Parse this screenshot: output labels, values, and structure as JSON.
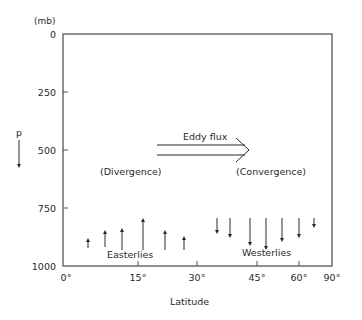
{
  "diagram": {
    "y_unit": "(mb)",
    "y_axis_symbol": "p",
    "y_ticks": [
      {
        "label": "0",
        "y": 34
      },
      {
        "label": "250",
        "y": 92
      },
      {
        "label": "500",
        "y": 150
      },
      {
        "label": "750",
        "y": 208
      },
      {
        "label": "1000",
        "y": 266
      }
    ],
    "x_ticks": [
      {
        "label": "0°",
        "x": 63
      },
      {
        "label": "15°",
        "x": 138
      },
      {
        "label": "30°",
        "x": 197
      },
      {
        "label": "45°",
        "x": 257
      },
      {
        "label": "60°",
        "x": 299
      },
      {
        "label": "90°",
        "x": 332
      }
    ],
    "x_label": "Latitude",
    "eddy_flux_label": "Eddy flux",
    "divergence_label": "(Divergence)",
    "convergence_label": "(Convergence)",
    "easterlies_label": "Easterlies",
    "westerlies_label": "Westerlies",
    "upward_arrows": [
      {
        "x": 88,
        "y1": 248,
        "y2": 240
      },
      {
        "x": 105,
        "y1": 247,
        "y2": 232
      },
      {
        "x": 122,
        "y1": 250,
        "y2": 230
      },
      {
        "x": 143,
        "y1": 250,
        "y2": 220
      },
      {
        "x": 165,
        "y1": 250,
        "y2": 232
      },
      {
        "x": 184,
        "y1": 250,
        "y2": 238
      }
    ],
    "downward_arrows": [
      {
        "x": 217,
        "y1": 218,
        "y2": 232
      },
      {
        "x": 230,
        "y1": 218,
        "y2": 236
      },
      {
        "x": 250,
        "y1": 218,
        "y2": 244
      },
      {
        "x": 266,
        "y1": 218,
        "y2": 248
      },
      {
        "x": 282,
        "y1": 218,
        "y2": 240
      },
      {
        "x": 299,
        "y1": 218,
        "y2": 236
      },
      {
        "x": 314,
        "y1": 218,
        "y2": 226
      }
    ],
    "colors": {
      "ink": "#2a2a2a",
      "frame": "#555555",
      "background": "#ffffff"
    }
  }
}
